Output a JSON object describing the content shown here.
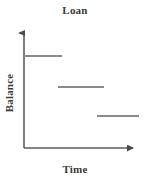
{
  "chart_data": {
    "type": "line",
    "subtype": "step",
    "title": "Loan",
    "xlabel": "Time",
    "ylabel": "Balance",
    "grid": false,
    "legend": false,
    "axis_ticks": false,
    "axis_tick_labels": false,
    "axis_style": "arrow-tipped-L-frame",
    "xlim": [
      0,
      3
    ],
    "ylim": [
      0,
      4
    ],
    "series": [
      {
        "name": "Balance",
        "color": "#8a8a8a",
        "step_segments": [
          {
            "index": 1,
            "x_start": 0.0,
            "x_end": 1.0,
            "y": 3.0
          },
          {
            "index": 2,
            "x_start": 1.0,
            "x_end": 2.0,
            "y": 2.0
          },
          {
            "index": 3,
            "x_start": 2.0,
            "x_end": 3.0,
            "y": 1.0
          }
        ],
        "x": [
          0.0,
          1.0,
          2.0,
          3.0
        ],
        "values": [
          3.0,
          2.0,
          1.0,
          1.0
        ],
        "note": "balance steps down once per period; segments drawn disjoint with no vertical risers"
      }
    ],
    "colors": {
      "background": "#ffffff",
      "axis": "#5c5c5c",
      "series": "#8a8a8a",
      "text": "#3a3a3a"
    },
    "geometry": {
      "origin_x": 24,
      "origin_y": 148,
      "y_axis_top": 29,
      "x_axis_right": 139,
      "segment_pixels": [
        {
          "x1": 24,
          "x2": 62,
          "y": 56
        },
        {
          "x1": 58,
          "x2": 104,
          "y": 87
        },
        {
          "x1": 97,
          "x2": 139,
          "y": 116
        }
      ]
    }
  }
}
